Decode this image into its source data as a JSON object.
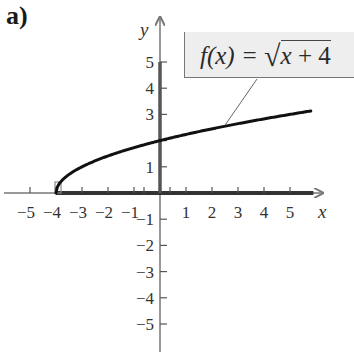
{
  "panel_label": "a)",
  "function_label": "f(x) = √x + 4",
  "chart_data": {
    "type": "line",
    "title": "",
    "function": "f(x) = sqrt(x + 4)",
    "xlabel": "x",
    "ylabel": "y",
    "xlim": [
      -5.5,
      6
    ],
    "ylim": [
      -6,
      6
    ],
    "x_ticks": [
      -5,
      -4,
      -3,
      -2,
      -1,
      1,
      2,
      3,
      4,
      5
    ],
    "y_ticks": [
      -5,
      -4,
      -3,
      -2,
      -1,
      1,
      3,
      4,
      5
    ],
    "x_tick_labels": [
      "−5",
      "−4",
      "−3",
      "−2",
      "−1",
      "1",
      "2",
      "3",
      "4",
      "5"
    ],
    "y_tick_labels": [
      "−5",
      "−4",
      "−3",
      "−2",
      "−1",
      "1",
      "3",
      "4",
      "5"
    ],
    "grid": false,
    "series": [
      {
        "name": "f(x) = √x + 4",
        "x": [
          -4,
          -3.75,
          -3,
          -2,
          -1,
          0,
          1,
          2,
          3,
          4,
          5,
          5.8
        ],
        "y": [
          0,
          0.5,
          1,
          1.41,
          1.73,
          2,
          2.24,
          2.45,
          2.65,
          2.83,
          3,
          3.13
        ]
      }
    ],
    "annotations": [
      {
        "text": "f(x) = √x + 4",
        "type": "callout-box",
        "points_to": [
          2.5,
          2.55
        ]
      },
      {
        "type": "highlight",
        "description": "domain [-4, ∞) bold on x-axis"
      },
      {
        "type": "highlight",
        "description": "range [0, ∞) bold on y-axis"
      }
    ]
  }
}
